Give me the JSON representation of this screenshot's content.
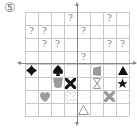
{
  "problem_label": "⑤",
  "grid": {
    "rows": 8,
    "cols": 8
  },
  "colors": {
    "black": "#111111",
    "gray": "#9a9a9a",
    "outline": "#888888",
    "grid": "#c8c8c8",
    "axis": "#888888",
    "question": "#777777"
  },
  "question_mark": "?",
  "question_cells": [
    {
      "row": 0,
      "col": 3
    },
    {
      "row": 0,
      "col": 6
    },
    {
      "row": 1,
      "col": 0
    },
    {
      "row": 1,
      "col": 1
    },
    {
      "row": 1,
      "col": 4
    },
    {
      "row": 2,
      "col": 1
    },
    {
      "row": 2,
      "col": 2
    },
    {
      "row": 2,
      "col": 6
    },
    {
      "row": 2,
      "col": 7
    },
    {
      "row": 3,
      "col": 4
    }
  ],
  "shapes": [
    {
      "row": 4,
      "col": 0,
      "shape": "diamond-cross",
      "fill": "black"
    },
    {
      "row": 4,
      "col": 2,
      "shape": "spade",
      "fill": "black"
    },
    {
      "row": 4,
      "col": 5,
      "shape": "flag-trapezoid",
      "fill": "gray"
    },
    {
      "row": 4,
      "col": 7,
      "shape": "triangle",
      "fill": "black"
    },
    {
      "row": 5,
      "col": 2,
      "shape": "cup",
      "fill": "gray"
    },
    {
      "row": 5,
      "col": 3,
      "shape": "x-cross",
      "fill": "black"
    },
    {
      "row": 5,
      "col": 5,
      "shape": "hourglass",
      "fill": "outline"
    },
    {
      "row": 5,
      "col": 7,
      "shape": "star",
      "fill": "black"
    },
    {
      "row": 6,
      "col": 1,
      "shape": "heart",
      "fill": "gray"
    },
    {
      "row": 6,
      "col": 3,
      "shape": "x-cross",
      "fill": "dotted-outline"
    },
    {
      "row": 6,
      "col": 6,
      "shape": "x-cross",
      "fill": "gray"
    },
    {
      "row": 7,
      "col": 4,
      "shape": "triangle",
      "fill": "outline"
    }
  ]
}
